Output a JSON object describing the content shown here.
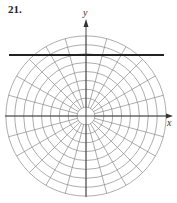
{
  "problem": {
    "number": "21."
  },
  "diagram": {
    "type": "polar-grid",
    "center": [
      86,
      116
    ],
    "ring_count": 9,
    "ring_spacing": 8.9,
    "spoke_count": 24,
    "spoke_step_deg": 15,
    "grid_color": "#8a8a8a",
    "axis_color": "#333333",
    "line_color": "#222222",
    "axes": {
      "x_label": "x",
      "y_label": "y"
    },
    "horizontal_line": {
      "y": 55,
      "x_start": 9,
      "x_end": 164
    }
  }
}
